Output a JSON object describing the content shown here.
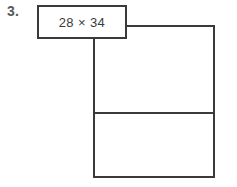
{
  "worksheet": {
    "problem_number": "3.",
    "expression": {
      "text": "28 × 34",
      "factor_a": "28",
      "operator": "×",
      "factor_b": "34"
    },
    "area_model": {
      "label": "area model rectangle",
      "rows": 2,
      "columns": 1,
      "cells": [
        {
          "name": "top-partial-product-cell",
          "value": ""
        },
        {
          "name": "bottom-partial-product-cell",
          "value": ""
        }
      ]
    },
    "colors": {
      "background": "#ffffff",
      "stroke": "#3a3a3c",
      "number_text": "#58595b",
      "expression_text": "#3a3a3c"
    }
  }
}
